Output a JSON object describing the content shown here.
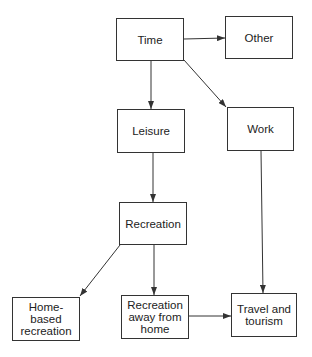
{
  "diagram": {
    "type": "flowchart",
    "nodes": [
      {
        "id": "time",
        "label": "Time"
      },
      {
        "id": "other",
        "label": "Other"
      },
      {
        "id": "leisure",
        "label": "Leisure"
      },
      {
        "id": "work",
        "label": "Work"
      },
      {
        "id": "recreation",
        "label": "Recreation"
      },
      {
        "id": "home_based",
        "label": "Home-based recreation"
      },
      {
        "id": "away_from_home",
        "label": "Recreation away from home"
      },
      {
        "id": "travel_tourism",
        "label": "Travel and tourism"
      }
    ],
    "edges": [
      {
        "from": "time",
        "to": "other"
      },
      {
        "from": "time",
        "to": "leisure"
      },
      {
        "from": "time",
        "to": "work"
      },
      {
        "from": "leisure",
        "to": "recreation"
      },
      {
        "from": "recreation",
        "to": "home_based"
      },
      {
        "from": "recreation",
        "to": "away_from_home"
      },
      {
        "from": "away_from_home",
        "to": "travel_tourism"
      },
      {
        "from": "work",
        "to": "travel_tourism"
      }
    ],
    "colors": {
      "stroke": "#333333",
      "fill": "#ffffff",
      "text": "#222222"
    }
  }
}
